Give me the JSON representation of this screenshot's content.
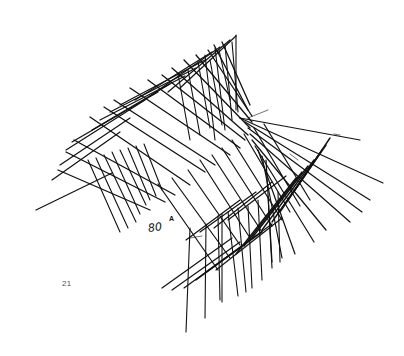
{
  "page": {
    "page_number": "21",
    "annotations": [
      {
        "id": "mark-80",
        "text": "80"
      },
      {
        "id": "mark-a",
        "text": "A"
      }
    ]
  },
  "sketch": {
    "description": "Hand-drawn ink sketch of crossed hatch lines forming a bent ribbon / folded surface",
    "ink_color": "#111111",
    "groups": [
      {
        "name": "upper-band-diagonals-down-right",
        "stroke_width": 1.3,
        "lines": [
          [
            58,
            170,
            150,
            210
          ],
          [
            66,
            152,
            165,
            202
          ],
          [
            74,
            140,
            175,
            195
          ],
          [
            90,
            117,
            190,
            185
          ],
          [
            104,
            107,
            205,
            172
          ],
          [
            114,
            100,
            215,
            165
          ],
          [
            130,
            88,
            230,
            155
          ],
          [
            148,
            80,
            240,
            148
          ],
          [
            162,
            75,
            245,
            140
          ],
          [
            172,
            68,
            248,
            135
          ],
          [
            184,
            60,
            250,
            128
          ],
          [
            196,
            55,
            252,
            122
          ],
          [
            208,
            50,
            252,
            116
          ],
          [
            214,
            45,
            248,
            110
          ],
          [
            222,
            42,
            250,
            105
          ]
        ]
      },
      {
        "name": "upper-band-diagonals-up-right",
        "stroke_width": 1.2,
        "lines": [
          [
            52,
            180,
            120,
            132
          ],
          [
            60,
            165,
            130,
            118
          ],
          [
            66,
            150,
            145,
            100
          ],
          [
            72,
            142,
            158,
            92
          ],
          [
            92,
            130,
            170,
            84
          ],
          [
            100,
            120,
            185,
            76
          ],
          [
            110,
            112,
            196,
            68
          ],
          [
            120,
            105,
            205,
            60
          ],
          [
            135,
            100,
            212,
            52
          ],
          [
            150,
            96,
            220,
            47
          ],
          [
            168,
            92,
            230,
            40
          ],
          [
            180,
            88,
            236,
            36
          ]
        ]
      },
      {
        "name": "upper-band-vertical-hatch",
        "stroke_width": 1.1,
        "lines": [
          [
            205,
            55,
            215,
            140
          ],
          [
            215,
            48,
            225,
            130
          ],
          [
            225,
            45,
            232,
            120
          ],
          [
            232,
            42,
            238,
            112
          ],
          [
            236,
            35,
            236,
            110
          ],
          [
            219,
            50,
            230,
            100
          ],
          [
            210,
            60,
            222,
            125
          ],
          [
            198,
            62,
            210,
            128
          ],
          [
            188,
            70,
            200,
            135
          ],
          [
            178,
            74,
            190,
            140
          ]
        ]
      },
      {
        "name": "left-lower-hatch",
        "stroke_width": 1.1,
        "lines": [
          [
            88,
            160,
            120,
            232
          ],
          [
            96,
            158,
            128,
            228
          ],
          [
            104,
            155,
            136,
            222
          ],
          [
            112,
            152,
            140,
            214
          ],
          [
            120,
            150,
            146,
            205
          ],
          [
            128,
            148,
            150,
            200
          ],
          [
            136,
            146,
            156,
            196
          ],
          [
            144,
            144,
            162,
            190
          ]
        ]
      },
      {
        "name": "long-left-arrow",
        "stroke_width": 1.2,
        "lines": [
          [
            36,
            210,
            112,
            173
          ]
        ]
      },
      {
        "name": "middle-diagonals",
        "stroke_width": 1.2,
        "lines": [
          [
            158,
            184,
            218,
            270
          ],
          [
            172,
            178,
            230,
            258
          ],
          [
            188,
            170,
            240,
            245
          ],
          [
            200,
            160,
            250,
            238
          ],
          [
            212,
            155,
            262,
            232
          ],
          [
            222,
            148,
            272,
            226
          ],
          [
            232,
            140,
            282,
            220
          ],
          [
            244,
            134,
            290,
            212
          ],
          [
            254,
            128,
            300,
            206
          ],
          [
            264,
            124,
            310,
            200
          ]
        ]
      },
      {
        "name": "right-fan-lines",
        "stroke_width": 1.2,
        "lines": [
          [
            240,
            118,
            360,
            140
          ],
          [
            240,
            118,
            383,
            183
          ],
          [
            245,
            122,
            370,
            200
          ],
          [
            248,
            128,
            362,
            212
          ],
          [
            250,
            134,
            350,
            222
          ],
          [
            252,
            140,
            326,
            230
          ],
          [
            255,
            146,
            314,
            242
          ],
          [
            258,
            150,
            295,
            254
          ],
          [
            262,
            156,
            282,
            258
          ],
          [
            266,
            160,
            272,
            262
          ]
        ]
      },
      {
        "name": "right-fold-edge",
        "stroke_width": 1.4,
        "lines": [
          [
            330,
            138,
            295,
            190
          ],
          [
            326,
            145,
            288,
            200
          ],
          [
            322,
            150,
            280,
            212
          ],
          [
            318,
            156,
            272,
            222
          ],
          [
            314,
            160,
            262,
            230
          ],
          [
            308,
            166,
            252,
            238
          ],
          [
            302,
            172,
            244,
            246
          ],
          [
            296,
            178,
            236,
            254
          ]
        ]
      },
      {
        "name": "lower-band-diagonals-up-right",
        "stroke_width": 1.2,
        "lines": [
          [
            162,
            288,
            232,
            238
          ],
          [
            172,
            290,
            240,
            242
          ],
          [
            184,
            288,
            250,
            240
          ],
          [
            196,
            280,
            262,
            232
          ],
          [
            206,
            272,
            272,
            224
          ],
          [
            216,
            270,
            282,
            218
          ],
          [
            186,
            240,
            240,
            200
          ],
          [
            200,
            232,
            256,
            192
          ],
          [
            214,
            228,
            272,
            182
          ],
          [
            228,
            220,
            286,
            176
          ]
        ]
      },
      {
        "name": "lower-band-vertical-drops",
        "stroke_width": 1.1,
        "lines": [
          [
            190,
            228,
            186,
            332
          ],
          [
            206,
            224,
            205,
            318
          ],
          [
            218,
            216,
            220,
            300
          ],
          [
            228,
            212,
            238,
            296
          ],
          [
            238,
            208,
            246,
            292
          ],
          [
            248,
            206,
            252,
            288
          ],
          [
            258,
            200,
            262,
            280
          ],
          [
            268,
            196,
            272,
            268
          ],
          [
            278,
            192,
            280,
            262
          ],
          [
            222,
            214,
            222,
            302
          ]
        ]
      },
      {
        "name": "stray-marks",
        "stroke_width": 0.6,
        "lines": [
          [
            248,
            118,
            268,
            110
          ],
          [
            190,
            238,
            202,
            236
          ],
          [
            334,
            134,
            340,
            135
          ],
          [
            290,
            154,
            298,
            160
          ]
        ]
      }
    ]
  }
}
